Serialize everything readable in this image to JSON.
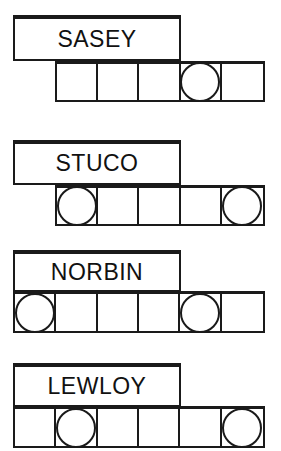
{
  "puzzle": {
    "cell_size": 42,
    "circle_diameter": 40,
    "accent_color": "#1a1a1a",
    "background_color": "#ffffff",
    "groups": [
      {
        "id": "group-sasey",
        "label": "SASEY",
        "label_left": 13,
        "label_top": 15,
        "label_width": 168,
        "label_height": 46,
        "row_left": 55,
        "row_top": 61,
        "row_height": 41,
        "cell_count": 5,
        "circle_cells": [
          4
        ]
      },
      {
        "id": "group-stuco",
        "label": "STUCO",
        "label_left": 13,
        "label_top": 140,
        "label_width": 168,
        "label_height": 45,
        "row_left": 55,
        "row_top": 185,
        "row_height": 41,
        "cell_count": 5,
        "circle_cells": [
          1,
          5
        ]
      },
      {
        "id": "group-norbin",
        "label": "NORBIN",
        "label_left": 13,
        "label_top": 250,
        "label_width": 168,
        "label_height": 42,
        "row_left": 13,
        "row_top": 291,
        "row_height": 42,
        "cell_count": 6,
        "circle_cells": [
          1,
          5
        ]
      },
      {
        "id": "group-lewloy",
        "label": "LEWLOY",
        "label_left": 13,
        "label_top": 363,
        "label_width": 168,
        "label_height": 44,
        "row_left": 13,
        "row_top": 406,
        "row_height": 42,
        "cell_count": 6,
        "circle_cells": [
          2,
          6
        ]
      }
    ]
  }
}
